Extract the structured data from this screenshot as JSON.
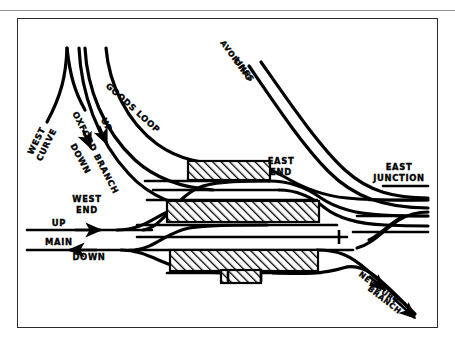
{
  "figure": {
    "kind": "railway-track-layout-diagram",
    "title": "",
    "background_color": "#ffffff",
    "ink_color": "#000000",
    "frame_color": "#2a2a2a",
    "top_rule_color": "#8d8d8d"
  },
  "labels": [
    {
      "id": "west-curve",
      "text": "WEST\nCURVE",
      "lines": [
        "WEST",
        "CURVE"
      ],
      "x": 22,
      "y": 122,
      "rotation": -62,
      "size": 8.4
    },
    {
      "id": "oxford-branch",
      "text": "OXFORD BRANCH",
      "lines": [
        "OXFORD BRANCH"
      ],
      "x": 55,
      "y": 108,
      "rotation": 63,
      "size": 8.4
    },
    {
      "id": "up",
      "text": "UP",
      "lines": [
        "UP"
      ],
      "x": 85,
      "y": 100,
      "rotation": 60,
      "size": 8.4
    },
    {
      "id": "down",
      "text": "DOWN",
      "lines": [
        "DOWN"
      ],
      "x": 56,
      "y": 140,
      "rotation": 62,
      "size": 8.4
    },
    {
      "id": "goods-loop",
      "text": "GOODS LOOP",
      "lines": [
        "GOODS LOOP"
      ],
      "x": 92,
      "y": 70,
      "rotation": 38,
      "size": 8.4
    },
    {
      "id": "avoiding-lines",
      "text": "AVOIDING\nLINES",
      "lines": [
        "AVOIDING",
        "LINES"
      ],
      "x": 210,
      "y": 38,
      "rotation": 52,
      "size": 8.0
    },
    {
      "id": "east-end",
      "text": "EAST\nEND",
      "lines": [
        "EAST",
        "END"
      ],
      "x": 265,
      "y": 148,
      "rotation": 0,
      "size": 8.4
    },
    {
      "id": "east-junction",
      "text": "EAST\nJUNCTION",
      "lines": [
        "EAST",
        "JUNCTION"
      ],
      "x": 382,
      "y": 156,
      "rotation": 0,
      "size": 8.4
    },
    {
      "id": "west-end",
      "text": "WEST\nEND",
      "lines": [
        "WEST",
        "END"
      ],
      "x": 70,
      "y": 186,
      "rotation": 0,
      "size": 8.4
    },
    {
      "id": "up-main",
      "text": "UP",
      "lines": [
        "UP"
      ],
      "x": 40,
      "y": 204,
      "rotation": 0,
      "size": 8.4
    },
    {
      "id": "main",
      "text": "MAIN",
      "lines": [
        "MAIN"
      ],
      "x": 27,
      "y": 224,
      "rotation": 0,
      "size": 8.4
    },
    {
      "id": "down-main",
      "text": "DOWN",
      "lines": [
        "DOWN"
      ],
      "x": 70,
      "y": 239,
      "rotation": 0,
      "size": 8.4
    },
    {
      "id": "newbury-branch",
      "text": "NEWBURY\nBRANCH",
      "lines": [
        "NEWBURY",
        "BRANCH"
      ],
      "x": 358,
      "y": 282,
      "rotation": 37,
      "size": 8.0
    }
  ],
  "platforms": [
    {
      "id": "platform-upper",
      "x": 171,
      "y": 143,
      "width": 82,
      "height": 19,
      "fill": "hatch-diagonal"
    },
    {
      "id": "platform-middle",
      "x": 150,
      "y": 183,
      "width": 152,
      "height": 21,
      "fill": "hatch-diagonal"
    },
    {
      "id": "platform-lower",
      "x": 153,
      "y": 232,
      "width": 148,
      "height": 21,
      "fill": "hatch-diagonal"
    },
    {
      "id": "platform-lower-stub",
      "x": 204,
      "y": 253,
      "width": 40,
      "height": 12,
      "fill": "hatch-diagonal"
    }
  ],
  "buffer_stops": [
    {
      "id": "buffer-stop-east-siding",
      "x": 322,
      "y": 219,
      "orientation": "vertical"
    },
    {
      "id": "buffer-stop-west-bay",
      "x": 211,
      "y": 259,
      "orientation": "vertical"
    },
    {
      "id": "buffer-stop-east-bay",
      "x": 244,
      "y": 259,
      "orientation": "vertical"
    }
  ],
  "arrows": [
    {
      "id": "arrow-up-main",
      "direction": "right",
      "x": 78,
      "y": 212
    },
    {
      "id": "arrow-down-main",
      "direction": "left",
      "x": 55,
      "y": 232
    },
    {
      "id": "arrow-oxford-up",
      "direction": "down",
      "x": 88,
      "y": 122
    },
    {
      "id": "arrow-oxford-down",
      "direction": "down",
      "x": 76,
      "y": 131
    },
    {
      "id": "arrow-newbury",
      "direction": "down-right",
      "x": 399,
      "y": 299
    },
    {
      "id": "arrow-newbury-upper",
      "direction": "down-right",
      "x": 372,
      "y": 275
    }
  ]
}
